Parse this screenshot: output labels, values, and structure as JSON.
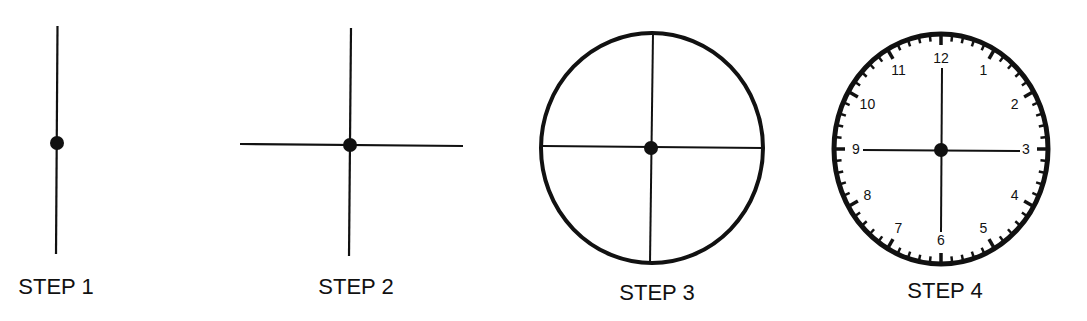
{
  "diagram": {
    "steps": [
      {
        "label": "STEP 1",
        "description": "Vertical line with center dot"
      },
      {
        "label": "STEP 2",
        "description": "Add horizontal line crossing at center dot"
      },
      {
        "label": "STEP 3",
        "description": "Draw circle around the cross"
      },
      {
        "label": "STEP 4",
        "description": "Add minute ticks and hour numbers to form clock face"
      }
    ],
    "clock_numbers": [
      "12",
      "1",
      "2",
      "3",
      "4",
      "5",
      "6",
      "7",
      "8",
      "9",
      "10",
      "11"
    ],
    "colors": {
      "ink": "#111111",
      "background": "#ffffff"
    }
  }
}
